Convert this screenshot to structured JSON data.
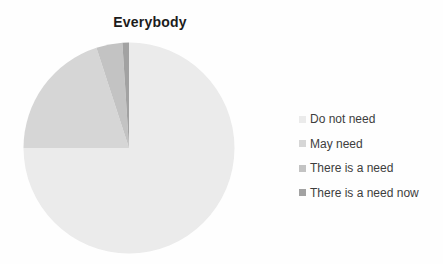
{
  "chart_data": {
    "type": "pie",
    "title": "Everybody",
    "categories": [
      "Do not need",
      "May need",
      "There is a need",
      "There is a need now"
    ],
    "values": [
      75,
      20,
      4,
      1
    ],
    "unit": "percent (estimated from slice angles; no data labels shown)",
    "colors": [
      "#ebebeb",
      "#d6d6d6",
      "#c3c3c3",
      "#a2a2a2"
    ],
    "legend_position": "right",
    "start_angle_deg": 0,
    "direction": "clockwise",
    "pie_geometry": {
      "cx": 129,
      "cy": 148,
      "r": 105.5
    }
  }
}
